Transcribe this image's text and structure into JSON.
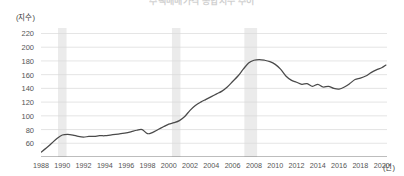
{
  "title": "주택매매가격 종합지수 추이",
  "axis": {
    "y_unit": "(지수)",
    "x_unit": "(년)",
    "y_ticks": [
      "220",
      "200",
      "180",
      "160",
      "140",
      "120",
      "100",
      "80",
      "60"
    ],
    "x_ticks": [
      "1988",
      "1990",
      "1992",
      "1994",
      "1996",
      "1998",
      "2000",
      "2002",
      "2004",
      "2006",
      "2008",
      "2010",
      "2012",
      "2014",
      "2016",
      "2018",
      "2020"
    ]
  },
  "colors": {
    "line": "#4a4a4a",
    "grid": "#d8d8d8",
    "band": "#ebebeb",
    "axis": "#7a7a7a",
    "text": "#555555"
  },
  "chart_data": {
    "type": "line",
    "title": "주택매매가격 종합지수 추이",
    "xlabel": "(년)",
    "ylabel": "(지수)",
    "xlim": [
      1988,
      2020.5
    ],
    "ylim": [
      40,
      228
    ],
    "yticks": [
      40,
      60,
      80,
      100,
      120,
      140,
      160,
      180,
      200,
      220
    ],
    "xticks": [
      1988,
      1990,
      1992,
      1994,
      1996,
      1998,
      2000,
      2002,
      2004,
      2006,
      2008,
      2010,
      2012,
      2014,
      2016,
      2018,
      2020
    ],
    "grid": true,
    "legend": "none",
    "shaded_bands": [
      {
        "label": "recession-band-1",
        "x0": 1989.6,
        "x1": 1990.4
      },
      {
        "label": "recession-band-2",
        "x0": 2000.3,
        "x1": 2001.1
      },
      {
        "label": "recession-band-3",
        "x0": 2007.1,
        "x1": 2008.3
      }
    ],
    "series": [
      {
        "name": "주택매매가격 종합지수",
        "x": [
          1988.0,
          1988.5,
          1989.0,
          1989.5,
          1990.0,
          1990.5,
          1991.0,
          1991.5,
          1992.0,
          1992.5,
          1993.0,
          1993.5,
          1994.0,
          1994.5,
          1995.0,
          1995.5,
          1996.0,
          1996.5,
          1997.0,
          1997.5,
          1998.0,
          1998.5,
          1999.0,
          1999.5,
          2000.0,
          2000.5,
          2001.0,
          2001.5,
          2002.0,
          2002.5,
          2003.0,
          2003.5,
          2004.0,
          2004.5,
          2005.0,
          2005.5,
          2006.0,
          2006.5,
          2007.0,
          2007.5,
          2008.0,
          2008.5,
          2009.0,
          2009.5,
          2010.0,
          2010.5,
          2011.0,
          2011.5,
          2012.0,
          2012.5,
          2013.0,
          2013.5,
          2014.0,
          2014.5,
          2015.0,
          2015.5,
          2016.0,
          2016.5,
          2017.0,
          2017.5,
          2018.0,
          2018.5,
          2019.0,
          2019.5,
          2020.0,
          2020.4
        ],
        "values": [
          47,
          53,
          60,
          67,
          72,
          73,
          72,
          70,
          69,
          70,
          70,
          71,
          71,
          72,
          73,
          74,
          75,
          77,
          79,
          80,
          74,
          76,
          80,
          84,
          88,
          90,
          93,
          99,
          108,
          115,
          120,
          124,
          128,
          132,
          136,
          142,
          150,
          158,
          168,
          177,
          181,
          182,
          181,
          179,
          175,
          168,
          158,
          152,
          149,
          146,
          147,
          143,
          146,
          142,
          143,
          140,
          139,
          142,
          147,
          153,
          155,
          158,
          163,
          167,
          170,
          174
        ]
      }
    ]
  }
}
